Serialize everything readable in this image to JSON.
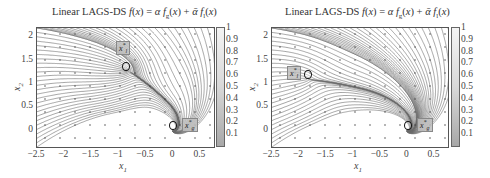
{
  "chart_data": [
    {
      "type": "streamplot",
      "title": "Linear LAGS-DS f(x) = αf_g(x) + ᾱf_l(x)",
      "title_parts": {
        "prefix": "Linear LAGS-DS ",
        "f": "f",
        "x": "(x) = α",
        "fg": "f",
        "g_sub": "g",
        "mid": "(x) + ᾱ",
        "fl": "f",
        "l_sub": "l",
        "end": "(x)"
      },
      "xlabel": "x1",
      "ylabel": "x2",
      "xlim": [
        -2.5,
        0.75
      ],
      "ylim": [
        -0.35,
        2.2
      ],
      "xticks": [
        "−2.5",
        "−2",
        "−1.5",
        "−1",
        "−0.5",
        "0",
        "0.5"
      ],
      "xtick_values": [
        -2.5,
        -2,
        -1.5,
        -1,
        -0.5,
        0,
        0.5
      ],
      "yticks": [
        "2",
        "1.5",
        "1",
        "0.5",
        "0"
      ],
      "ytick_values": [
        2,
        1.5,
        1,
        0.5,
        0
      ],
      "colorbar": {
        "range": [
          0,
          1
        ],
        "ticks": [
          "1",
          "0.9",
          "0.8",
          "0.7",
          "0.6",
          "0.5",
          "0.4",
          "0.3",
          "0.2",
          "0.1"
        ],
        "colormap": "gray"
      },
      "attractors": [
        {
          "label": "x_l*",
          "x": -0.85,
          "y": 1.3
        },
        {
          "label": "x_g*",
          "x": 0.0,
          "y": 0.0
        }
      ],
      "grid": false
    },
    {
      "type": "streamplot",
      "title": "Linear LAGS-DS f(x) = αf_g(x) + ᾱf_l(x)",
      "xlabel": "x1",
      "ylabel": "x2",
      "xlim": [
        -2.5,
        0.75
      ],
      "ylim": [
        -0.35,
        2.2
      ],
      "xticks": [
        "−2.5",
        "−2",
        "−1.5",
        "−1",
        "−0.5",
        "0",
        "0.5"
      ],
      "xtick_values": [
        -2.5,
        -2,
        -1.5,
        -1,
        -0.5,
        0,
        0.5
      ],
      "yticks": [
        "2",
        "1.5",
        "1",
        "0.5",
        "0"
      ],
      "ytick_values": [
        2,
        1.5,
        1,
        0.5,
        0
      ],
      "colorbar": {
        "range": [
          0,
          1
        ],
        "ticks": [
          "1",
          "0.9",
          "0.8",
          "0.7",
          "0.6",
          "0.5",
          "0.4",
          "0.3",
          "0.2",
          "0.1"
        ],
        "colormap": "gray"
      },
      "attractors": [
        {
          "label": "x_l*",
          "x": -1.85,
          "y": 1.1
        },
        {
          "label": "x_g*",
          "x": 0.0,
          "y": 0.0
        }
      ],
      "grid": false
    }
  ],
  "labels": {
    "x1": "x",
    "x1_sub": "1",
    "x2": "x",
    "x2_sub": "2",
    "xl": "x",
    "xl_sub": "l",
    "xl_sup": "*",
    "xg": "x",
    "xg_sub": "g",
    "xg_sup": "*"
  }
}
